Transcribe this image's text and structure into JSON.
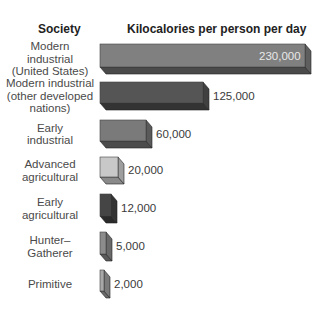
{
  "chart_data": {
    "type": "bar",
    "orientation": "horizontal",
    "title": "",
    "xlabel": "Kilocalories per person per day",
    "ylabel": "Society",
    "categories": [
      "Modern industrial (United States)",
      "Modern industrial (other developed nations)",
      "Early industrial",
      "Advanced agricultural",
      "Early agricultural",
      "Hunter-Gatherer",
      "Primitive"
    ],
    "values": [
      230000,
      125000,
      60000,
      20000,
      12000,
      5000,
      2000
    ],
    "value_labels": [
      "230,000",
      "125,000",
      "60,000",
      "20,000",
      "12,000",
      "5,000",
      "2,000"
    ],
    "grid": false,
    "legend": null,
    "style": "3d-blocks"
  },
  "headers": {
    "society": "Society",
    "kcal": "Kilocalories per person per day"
  },
  "rows": [
    {
      "label": "Modern\nindustrial\n(United States)",
      "value": "230,000",
      "front": "#808080",
      "side": "#5e5e5e",
      "bottom": "#4a4a4a"
    },
    {
      "label": "Modern industrial\n(other developed\nnations)",
      "value": "125,000",
      "front": "#555555",
      "side": "#404040",
      "bottom": "#333333"
    },
    {
      "label": "Early\nindustrial",
      "value": "60,000",
      "front": "#7a7a7a",
      "side": "#5a5a5a",
      "bottom": "#4c4c4c"
    },
    {
      "label": "Advanced\nagricultural",
      "value": "20,000",
      "front": "#c8c8c8",
      "side": "#9e9e9e",
      "bottom": "#8a8a8a"
    },
    {
      "label": "Early\nagricultural",
      "value": "12,000",
      "front": "#454545",
      "side": "#333333",
      "bottom": "#2a2a2a"
    },
    {
      "label": "Hunter–\nGatherer",
      "value": "5,000",
      "front": "#8c8c8c",
      "side": "#6a6a6a",
      "bottom": "#5a5a5a"
    },
    {
      "label": "Primitive",
      "value": "2,000",
      "front": "#a8a8a8",
      "side": "#7a7a7a",
      "bottom": "#6a6a6a"
    }
  ]
}
